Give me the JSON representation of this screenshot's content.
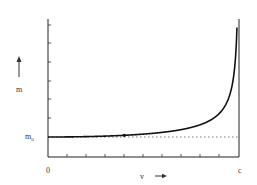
{
  "chart_data": {
    "type": "line",
    "title": "",
    "xlabel": "v",
    "ylabel": "m",
    "x_tick_labels": [
      "0",
      "c"
    ],
    "y_tick_labels": [
      "m0"
    ],
    "x_ticks_count": 9,
    "y_ticks_count": 6,
    "grid": false,
    "legend": null,
    "series": [
      {
        "name": "m = m0 / sqrt(1 - v^2/c^2)",
        "x": [
          0,
          0.1,
          0.2,
          0.3,
          0.4,
          0.5,
          0.6,
          0.7,
          0.8,
          0.9,
          0.95,
          0.98,
          0.99,
          0.995
        ],
        "values": [
          1.0,
          1.005,
          1.021,
          1.048,
          1.091,
          1.155,
          1.25,
          1.4,
          1.667,
          2.294,
          3.203,
          5.025,
          7.089,
          10.0
        ]
      }
    ],
    "reference_line": {
      "label": "m0",
      "y": 1.0,
      "style": "dotted"
    },
    "marked_point": {
      "x": 0.4,
      "y": 1.091
    },
    "xlim": [
      0,
      1
    ],
    "ylim": [
      0.7,
      10.5
    ]
  },
  "labels": {
    "y_axis": "m",
    "x_axis": "v",
    "m0_main": "m",
    "m0_sub": "0",
    "origin": "0",
    "c": "c"
  }
}
